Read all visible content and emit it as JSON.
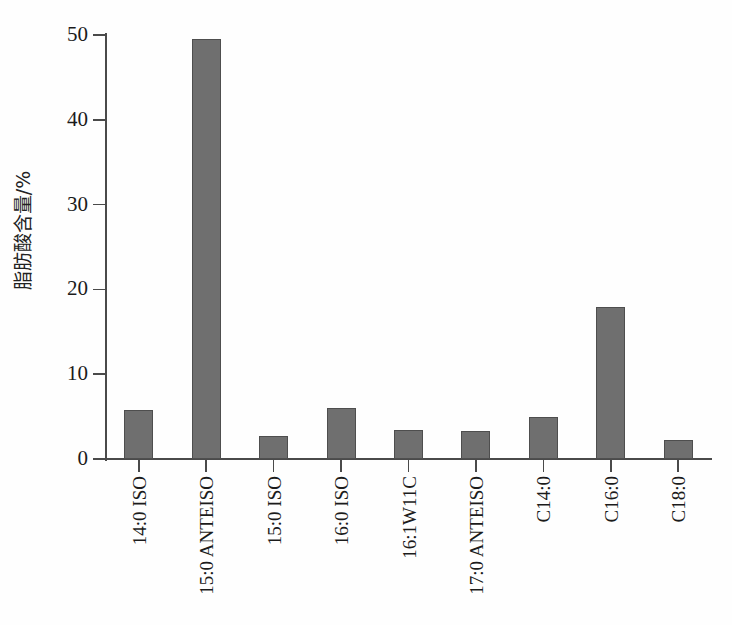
{
  "chart_data": {
    "type": "bar",
    "title": "",
    "xlabel": "",
    "ylabel": "脂肪酸含量/%",
    "categories": [
      "14:0 ISO",
      "15:0 ANTEISO",
      "15:0 ISO",
      "16:0 ISO",
      "16:1W11C",
      "17:0 ANTEISO",
      "C14:0",
      "C16:0",
      "C18:0"
    ],
    "values": [
      5.8,
      49.5,
      2.7,
      6.0,
      3.4,
      3.3,
      5.0,
      17.9,
      2.2
    ],
    "ylim": [
      0,
      50
    ],
    "yticks": [
      0,
      10,
      20,
      30,
      40,
      50
    ],
    "ytick_labels": [
      "0",
      "10",
      "20",
      "30",
      "40",
      "50"
    ],
    "grid": false,
    "legend": false,
    "bar_color": "#6f6f6f",
    "bar_edge_color": "#4e4e4e",
    "axis_color": "#4a4a4a",
    "background_color": "#fefefe"
  }
}
